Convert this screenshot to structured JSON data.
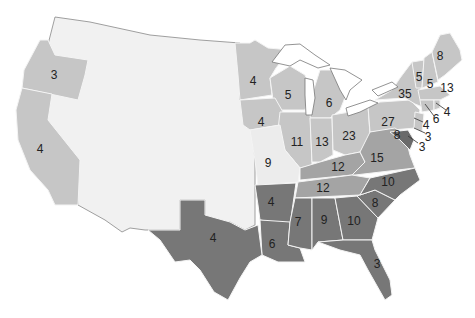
{
  "map": {
    "subject": "Electoral votes by state",
    "colors": {
      "north": "#c6c6c6",
      "border_states": "#a4a4a4",
      "south": "#777777",
      "missouri": "#ededed",
      "territories": "#f1f1f1",
      "background": "#ffffff"
    },
    "labels": {
      "OR": "3",
      "CA": "4",
      "MN": "4",
      "WI": "5",
      "MI": "6",
      "IA": "4",
      "IL": "11",
      "IN": "13",
      "OH": "23",
      "PA": "27",
      "NY": "35",
      "VT": "5",
      "NH": "5",
      "ME": "8",
      "MA": "13",
      "RI": "4",
      "CT": "6",
      "NJ": "4",
      "DE": "3",
      "MD": "3",
      "MD_inner": "8",
      "MO": "9",
      "KY": "12",
      "TN": "12",
      "VA": "15",
      "NC": "10",
      "SC": "8",
      "GA": "10",
      "AL": "9",
      "MS": "7",
      "LA": "6",
      "AR": "4",
      "TX": "4",
      "FL": "3"
    }
  }
}
